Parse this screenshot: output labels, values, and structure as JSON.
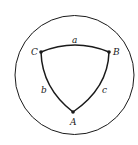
{
  "diagram": {
    "sphere": {
      "cx": 74.5,
      "cy": 75,
      "r": 59.5
    },
    "vertices": [
      {
        "id": "A",
        "label": "A",
        "x": 73,
        "y": 112,
        "lx": 70,
        "ly": 125
      },
      {
        "id": "B",
        "label": "B",
        "x": 109,
        "y": 52,
        "lx": 113,
        "ly": 55
      },
      {
        "id": "C",
        "label": "C",
        "x": 41,
        "y": 52,
        "lx": 31,
        "ly": 55
      }
    ],
    "sides": [
      {
        "id": "a",
        "label": "a",
        "from": "C",
        "to": "B",
        "lx": 72,
        "ly": 46
      },
      {
        "id": "b",
        "label": "b",
        "from": "C",
        "to": "A",
        "lx": 41,
        "ly": 91
      },
      {
        "id": "c",
        "label": "c",
        "from": "B",
        "to": "A",
        "lx": 102,
        "ly": 91
      }
    ],
    "colors": {
      "stroke": "#1a1a1a",
      "background": "#ffffff"
    }
  }
}
